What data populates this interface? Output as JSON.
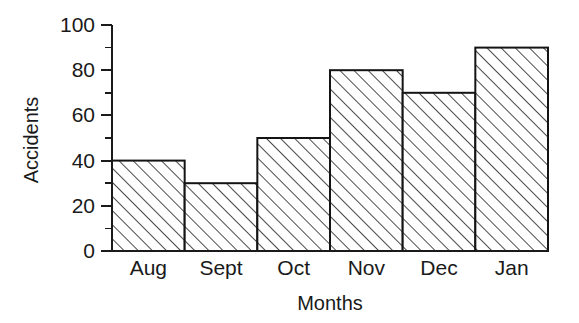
{
  "chart_data": {
    "type": "bar",
    "title": "",
    "subtitle": "",
    "xlabel": "Months",
    "ylabel": "Accidents",
    "categories": [
      "Aug",
      "Sept",
      "Oct",
      "Nov",
      "Dec",
      "Jan"
    ],
    "values": [
      40,
      30,
      50,
      80,
      70,
      90
    ],
    "ylim": [
      0,
      100
    ],
    "xlim_categories": 6,
    "ytick_labels": [
      "0",
      "20",
      "40",
      "60",
      "80",
      "100"
    ],
    "ytick_values": [
      0,
      20,
      40,
      60,
      80,
      100
    ],
    "yminor_tick_values": [
      10,
      30,
      50,
      70,
      90
    ],
    "grid": false,
    "legend": null,
    "legend_position": "none",
    "bar_style": {
      "fill_pattern": "diagonal-hatch",
      "fill_color": "#ffffff",
      "hatch_color": "#2b2b2b",
      "edge_color": "#141414",
      "gap": 0
    },
    "annotations": [],
    "background_color": "#ffffff",
    "axis_color": "#1a1a1a"
  },
  "axes": {
    "y_axis_title": "Accidents",
    "x_axis_title": "Months"
  }
}
